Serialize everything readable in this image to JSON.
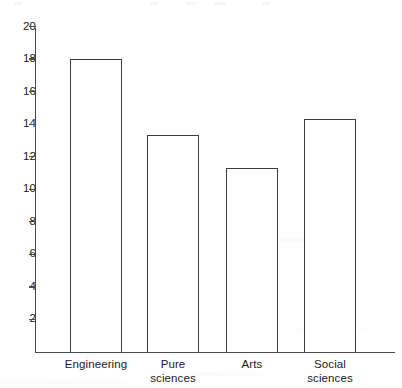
{
  "chart_data": {
    "type": "bar",
    "title": "",
    "subtitle": "",
    "xlabel": "",
    "ylabel": "",
    "categories": [
      "Engineering",
      "Pure sciences",
      "Arts",
      "Social sciences"
    ],
    "category_lines": [
      [
        "Engineering"
      ],
      [
        "Pure",
        "sciences"
      ],
      [
        "Arts"
      ],
      [
        "Social",
        "sciences"
      ]
    ],
    "values": [
      18.0,
      13.35,
      11.3,
      14.3
    ],
    "ylim": [
      0,
      21
    ],
    "ytick_values": [
      2,
      4,
      6,
      8,
      10,
      12,
      14,
      16,
      18,
      20
    ],
    "ytick_labels": [
      "2",
      "4",
      "6",
      "8",
      "10",
      "12",
      "14",
      "16",
      "18",
      "20"
    ],
    "grid": false,
    "legend": false,
    "legend_position": "none",
    "bar_fill": "#ffffff",
    "bar_edge_color": "#3d3d3d",
    "axis_color": "#4a4a4a",
    "background": "#ffffff"
  }
}
